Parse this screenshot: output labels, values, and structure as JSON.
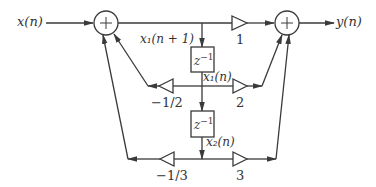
{
  "diagram": {
    "type": "signal-flow block diagram (state-space realization)",
    "stroke_color": "#3a3a3a",
    "input_label": "x(n)",
    "output_label": "y(n)",
    "state1_next_label": "x₁(n + 1)",
    "state1_label": "x₁(n)",
    "state2_label": "x₂(n)",
    "delay_blocks": [
      {
        "label": "z",
        "exponent": "−1"
      },
      {
        "label": "z",
        "exponent": "−1"
      }
    ],
    "adders": [
      {
        "symbol": "+",
        "role": "input summing junction"
      },
      {
        "symbol": "+",
        "role": "output summing junction"
      }
    ],
    "gains": {
      "direct": "1",
      "feedback_1": "−1/2",
      "feedforward_1": "2",
      "feedback_2": "−1/3",
      "feedforward_2": "3"
    }
  }
}
